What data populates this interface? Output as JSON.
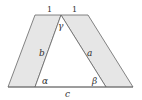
{
  "diagram": {
    "colors": {
      "shade": "#e6e6e6",
      "stroke": "#666666",
      "text": "#333333",
      "background": "#ffffff"
    },
    "labels": {
      "top_left_length": "1",
      "top_right_length": "1",
      "side_b": "b",
      "side_a": "a",
      "base_c": "c",
      "angle_alpha": "α",
      "angle_beta": "β",
      "angle_gamma": "γ"
    },
    "vertices": {
      "outer_top_left": [
        35,
        15
      ],
      "apex": [
        61,
        15
      ],
      "outer_top_right": [
        88,
        15
      ],
      "outer_bottom_left": [
        8,
        87
      ],
      "inner_bottom_left": [
        35,
        87
      ],
      "inner_bottom_right": [
        106,
        87
      ],
      "outer_bottom_right": [
        133,
        87
      ]
    }
  }
}
